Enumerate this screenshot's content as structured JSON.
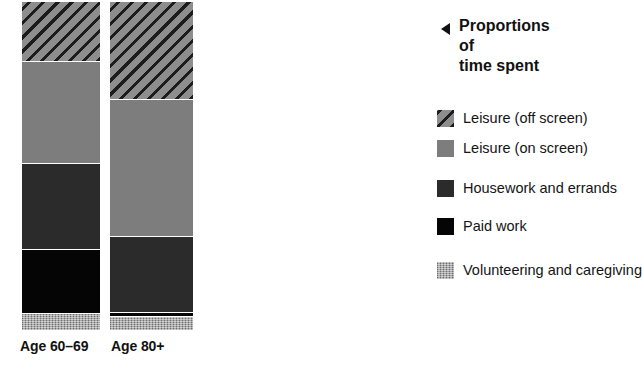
{
  "callout": {
    "arrow_icon": "left-triangle-icon",
    "text": "Proportions of\ntime spent"
  },
  "legend": {
    "items": [
      {
        "key": "leisure_off_screen",
        "label": "Leisure (off screen)",
        "color": "#6f6f6f",
        "pattern": "diagonal-hatch"
      },
      {
        "key": "leisure_on_screen",
        "label": "Leisure (on screen)",
        "color": "#7d7d7d",
        "pattern": "solid"
      },
      {
        "key": "housework_and_errands",
        "label": "Housework and errands",
        "color": "#2b2b2b",
        "pattern": "solid"
      },
      {
        "key": "paid_work",
        "label": "Paid work",
        "color": "#050505",
        "pattern": "solid"
      },
      {
        "key": "volunteering_and_caregiving",
        "label": "Volunteering and caregiving",
        "color": "#a8a8a8",
        "pattern": "speckle"
      }
    ]
  },
  "chart_data": {
    "type": "bar",
    "subtype": "stacked-100-percent",
    "title": "Proportions of time spent",
    "xlabel": "",
    "ylabel": "",
    "ylim": [
      0,
      100
    ],
    "grid": false,
    "legend_position": "right",
    "orientation": "vertical",
    "categories": [
      "Age 60–69",
      "Age 80+"
    ],
    "series": [
      {
        "name": "Leisure (off screen)",
        "values": [
          18,
          30
        ],
        "color": "#6f6f6f"
      },
      {
        "name": "Leisure (on screen)",
        "values": [
          31,
          42
        ],
        "color": "#7d7d7d"
      },
      {
        "name": "Housework and errands",
        "values": [
          26,
          23
        ],
        "color": "#2b2b2b"
      },
      {
        "name": "Paid work",
        "values": [
          19,
          1
        ],
        "color": "#050505"
      },
      {
        "name": "Volunteering and caregiving",
        "values": [
          5,
          4
        ],
        "color": "#a8a8a8"
      }
    ],
    "stack_order_top_to_bottom": [
      "Leisure (off screen)",
      "Leisure (on screen)",
      "Housework and errands",
      "Paid work",
      "Volunteering and caregiving"
    ],
    "annotations": [
      {
        "text": "Proportions of time spent",
        "marker": "left-triangle"
      }
    ]
  },
  "bars": [
    {
      "label": "Age 60–69",
      "segments": [
        {
          "key": "leisure_off_screen",
          "percent": 18
        },
        {
          "key": "leisure_on_screen",
          "percent": 31
        },
        {
          "key": "housework_and_errands",
          "percent": 26
        },
        {
          "key": "paid_work",
          "percent": 19
        },
        {
          "key": "volunteering_and_caregiving",
          "percent": 5
        }
      ]
    },
    {
      "label": "Age 80+",
      "segments": [
        {
          "key": "leisure_off_screen",
          "percent": 30
        },
        {
          "key": "leisure_on_screen",
          "percent": 42
        },
        {
          "key": "housework_and_errands",
          "percent": 23
        },
        {
          "key": "paid_work",
          "percent": 1
        },
        {
          "key": "volunteering_and_caregiving",
          "percent": 4
        }
      ]
    }
  ]
}
